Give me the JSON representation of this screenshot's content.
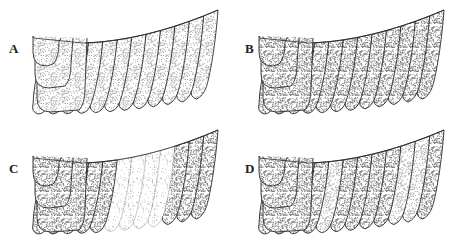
{
  "figure": {
    "panels": [
      {
        "id": "A",
        "label": "A",
        "label_pos": [
          9,
          42
        ],
        "origin": [
          0,
          0
        ],
        "strip_shades": [
          "light",
          "light",
          "light",
          "light",
          "light",
          "light",
          "light",
          "light",
          "light",
          "light",
          "light",
          "light"
        ]
      },
      {
        "id": "B",
        "label": "B",
        "label_pos": [
          245,
          42
        ],
        "origin": [
          226,
          0
        ],
        "strip_shades": [
          "medium",
          "medium",
          "medium",
          "medium",
          "medium",
          "medium",
          "medium",
          "medium",
          "medium",
          "medium",
          "medium",
          "medium"
        ]
      },
      {
        "id": "C",
        "label": "C",
        "label_pos": [
          9,
          162
        ],
        "origin": [
          0,
          120
        ],
        "strip_shades": [
          "medium",
          "medium",
          "medium",
          "medium",
          "medium",
          "faint",
          "faint",
          "faint",
          "faint",
          "medium",
          "medium",
          "medium"
        ]
      },
      {
        "id": "D",
        "label": "D",
        "label_pos": [
          245,
          162
        ],
        "origin": [
          226,
          120
        ],
        "strip_shades": [
          "medium",
          "medium",
          "medium",
          "medium",
          "light",
          "medium",
          "medium",
          "medium",
          "medium",
          "light",
          "light",
          "medium"
        ]
      }
    ],
    "shade_colors": {
      "faint": "#b0b0b0",
      "light": "#9a9a9a",
      "medium": "#6e6e6e"
    },
    "shade_densities": {
      "faint": 0.1,
      "light": 0.28,
      "medium": 0.45
    },
    "outline_color": "#2a2a2a"
  }
}
